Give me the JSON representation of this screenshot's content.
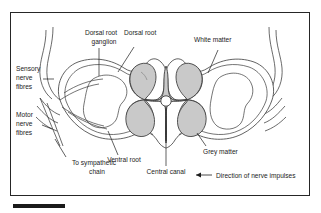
{
  "figure": {
    "type": "biological-diagram",
    "background_color": "#ffffff",
    "frame_color": "#262626",
    "grey_matter_fill": "#c9c9c9",
    "outline_color": "#3a3a3a",
    "label_color": "#1c1c1c"
  },
  "labels": {
    "dorsal_root_ganglion_l1": "Dorsal root",
    "dorsal_root_ganglion_l2": "ganglion",
    "dorsal_root": "Dorsal root",
    "white_matter": "White matter",
    "sensory_nerve_fibres_l1": "Sensory",
    "sensory_nerve_fibres_l2": "nerve",
    "sensory_nerve_fibres_l3": "fibres",
    "motor_nerve_fibres_l1": "Motor",
    "motor_nerve_fibres_l2": "nerve",
    "motor_nerve_fibres_l3": "fibres",
    "to_sympathetic_chain_l1": "To sympathetic",
    "to_sympathetic_chain_l2": "chain",
    "ventral_root": "Ventral root",
    "central_canal": "Central canal",
    "grey_matter": "Grey matter",
    "legend_direction": "Direction of nerve impulses"
  },
  "structures": [
    {
      "name": "dorsal-root-ganglion",
      "side": "left"
    },
    {
      "name": "dorsal-root",
      "side": "left"
    },
    {
      "name": "ventral-root",
      "side": "left"
    },
    {
      "name": "sympathetic-chain-branch",
      "side": "left"
    },
    {
      "name": "sensory-nerve-fibres",
      "side": "left"
    },
    {
      "name": "motor-nerve-fibres",
      "side": "left"
    },
    {
      "name": "white-matter",
      "side": "both"
    },
    {
      "name": "grey-matter",
      "side": "center"
    },
    {
      "name": "central-canal",
      "side": "center"
    }
  ],
  "legend": {
    "arrow_direction": "left",
    "arrow_color": "#1c1c1c"
  }
}
